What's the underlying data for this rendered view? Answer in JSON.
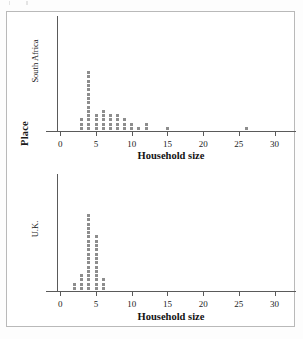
{
  "figure": {
    "outer_axis_label": "Place",
    "dot_color": "#8d8d8d",
    "axis_color": "#5a5a5a"
  },
  "panels": [
    {
      "id": "sa",
      "name": "South Africa",
      "xlabel": "Household size"
    },
    {
      "id": "uk",
      "name": "U.K.",
      "xlabel": "Household size"
    }
  ],
  "axis": {
    "ticks": [
      0,
      5,
      10,
      15,
      20,
      25,
      30
    ],
    "tick_labels": [
      "0",
      "5",
      "10",
      "15",
      "20",
      "25",
      "30"
    ],
    "xmin": -2,
    "xmax": 33
  },
  "chart_data": [
    {
      "type": "scatter",
      "title": "South Africa",
      "subtitle": "",
      "xlabel": "Household size",
      "ylabel": "South Africa",
      "xlim": [
        -2,
        33
      ],
      "grid": false,
      "legend": "none",
      "plot_style": "dot plot (stacked dots, each dot = 1 observation)",
      "categories": [
        3,
        4,
        5,
        6,
        7,
        8,
        9,
        10,
        11,
        12,
        15,
        26
      ],
      "values": [
        3,
        14,
        4,
        5,
        4,
        4,
        3,
        2,
        1,
        2,
        1,
        1
      ],
      "annotations": []
    },
    {
      "type": "scatter",
      "title": "U.K.",
      "subtitle": "",
      "xlabel": "Household size",
      "ylabel": "U.K.",
      "xlim": [
        -2,
        33
      ],
      "grid": false,
      "legend": "none",
      "plot_style": "dot plot (stacked dots, each dot = 1 observation)",
      "categories": [
        2,
        3,
        4,
        5,
        6
      ],
      "values": [
        2,
        4,
        18,
        13,
        3
      ],
      "annotations": []
    }
  ]
}
